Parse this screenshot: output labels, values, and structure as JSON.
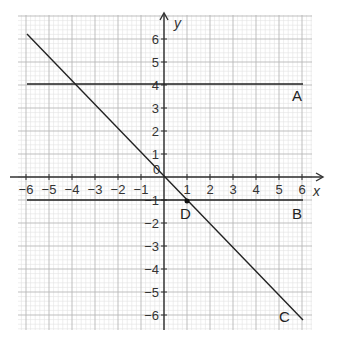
{
  "chart_data": {
    "type": "line",
    "title": "",
    "xlabel": "x",
    "ylabel": "y",
    "xlim": [
      -6,
      6
    ],
    "ylim": [
      -6,
      6
    ],
    "grid": true,
    "x_ticks": [
      "-6",
      "-5",
      "-4",
      "-3",
      "-2",
      "-1",
      "1",
      "2",
      "3",
      "4",
      "5",
      "6"
    ],
    "y_ticks": [
      "6",
      "5",
      "4",
      "3",
      "2",
      "1",
      "-1",
      "-2",
      "-3",
      "-4",
      "-5",
      "-6"
    ],
    "origin_label": "0",
    "series": [
      {
        "name": "A",
        "equation": "y = 4",
        "points": [
          [
            -6,
            4
          ],
          [
            6,
            4
          ]
        ]
      },
      {
        "name": "B",
        "equation": "y = -1",
        "points": [
          [
            -6,
            -1
          ],
          [
            6,
            -1
          ]
        ]
      },
      {
        "name": "C",
        "equation": "y = -x",
        "points": [
          [
            -6,
            6
          ],
          [
            6,
            -6
          ]
        ]
      }
    ],
    "annotations": [
      {
        "label": "D",
        "point": [
          1,
          -1
        ],
        "marker": "dot"
      }
    ]
  },
  "labels": {
    "x_axis": "x",
    "y_axis": "y",
    "origin": "0",
    "line_a": "A",
    "line_b": "B",
    "line_c": "C",
    "point_d": "D"
  },
  "colors": {
    "minor_grid": "#e2e2e2",
    "major_grid": "#b8b8b8",
    "axis": "#333333",
    "line": "#222222"
  }
}
